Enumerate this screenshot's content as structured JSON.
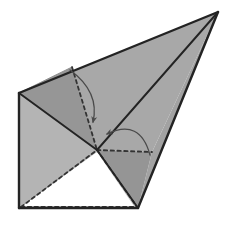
{
  "figure": {
    "type": "geometric-solid-diagram",
    "canvas": {
      "width": 235,
      "height": 235,
      "background": "#ffffff"
    },
    "colors": {
      "background": "#ffffff",
      "face_light": "#c9c9c9",
      "face_mid": "#b0b0b0",
      "face_medium": "#a8a8a8",
      "face_dark": "#999999",
      "face_darker": "#8f8f8f",
      "face_white": "#ffffff",
      "edge_solid": "#232323",
      "edge_thin": "#7a7a7a",
      "edge_hidden": "#3a3a3a",
      "arrow": "#4a4a4a"
    },
    "vertices": {
      "apex_top_right": [
        218,
        12
      ],
      "left": [
        19,
        93
      ],
      "bottom_left": [
        19,
        208
      ],
      "bottom_right": [
        138,
        208
      ],
      "hidden_center": [
        97,
        150
      ],
      "hidden_upper": [
        72,
        67
      ],
      "hidden_right": [
        152,
        152
      ]
    },
    "faces": [
      {
        "name": "upper-large-face",
        "shade": "#a8a8a8",
        "points": "19,93 218,12 152,152 97,150"
      },
      {
        "name": "upper-left-dark-face",
        "shade": "#969696",
        "points": "19,93 72,67 97,150"
      },
      {
        "name": "left-side-face",
        "shade": "#b4b4b4",
        "points": "19,93 97,150 19,208"
      },
      {
        "name": "lower-white-face",
        "shade": "#ffffff",
        "points": "19,208 97,150 138,208"
      },
      {
        "name": "lower-right-dark-face",
        "shade": "#959595",
        "points": "97,150 152,152 138,208"
      },
      {
        "name": "right-lower-face",
        "shade": "#a2a2a2",
        "points": "152,152 218,12 138,208"
      },
      {
        "name": "bottom-strip-face",
        "shade": "#b8b8b8",
        "points": "19,208 138,208 97,150"
      }
    ],
    "solid_edges": [
      {
        "name": "edge-left-to-apex",
        "from": [
          19,
          93
        ],
        "to": [
          218,
          12
        ]
      },
      {
        "name": "edge-apex-to-bottom-right",
        "from": [
          218,
          12
        ],
        "to": [
          138,
          208
        ]
      },
      {
        "name": "edge-bottom",
        "from": [
          19,
          208
        ],
        "to": [
          138,
          208
        ]
      },
      {
        "name": "edge-left-vertical",
        "from": [
          19,
          93
        ],
        "to": [
          19,
          208
        ]
      },
      {
        "name": "edge-apex-to-hidden-center",
        "from": [
          218,
          12
        ],
        "to": [
          97,
          150
        ]
      },
      {
        "name": "edge-left-to-hidden-center",
        "from": [
          19,
          93
        ],
        "to": [
          97,
          150
        ]
      },
      {
        "name": "edge-hidden-center-to-bottom-right",
        "from": [
          97,
          150
        ],
        "to": [
          138,
          208
        ]
      }
    ],
    "thin_edges": [
      {
        "name": "thin-edge-bottom-left-to-hidden-center",
        "from": [
          19,
          208
        ],
        "to": [
          97,
          150
        ]
      },
      {
        "name": "thin-edge-bottom-left-diagonal",
        "from": [
          19,
          208
        ],
        "to": [
          138,
          208
        ]
      },
      {
        "name": "thin-edge-left-to-upper-hidden",
        "from": [
          19,
          93
        ],
        "to": [
          72,
          67
        ]
      }
    ],
    "dashed_edges": [
      {
        "name": "dashed-upper-fold",
        "from": [
          72,
          67
        ],
        "to": [
          97,
          150
        ]
      },
      {
        "name": "dashed-left-fold",
        "from": [
          19,
          93
        ],
        "to": [
          19,
          208
        ]
      },
      {
        "name": "dashed-bottom-left-to-hidden-center",
        "from": [
          19,
          208
        ],
        "to": [
          97,
          150
        ]
      },
      {
        "name": "dashed-bottom-fold",
        "from": [
          19,
          208
        ],
        "to": [
          138,
          208
        ]
      },
      {
        "name": "dashed-right-fold",
        "from": [
          97,
          150
        ],
        "to": [
          152,
          152
        ]
      },
      {
        "name": "dashed-hidden-center-to-bottom-right",
        "from": [
          97,
          150
        ],
        "to": [
          138,
          208
        ]
      }
    ],
    "arrows": [
      {
        "name": "fold-arrow-upper",
        "start": [
          70,
          70
        ],
        "control": [
          100,
          92
        ],
        "end": [
          93,
          122
        ],
        "label": ""
      },
      {
        "name": "fold-arrow-lower",
        "start": [
          150,
          155
        ],
        "control": [
          140,
          118
        ],
        "end": [
          107,
          134
        ],
        "label": ""
      }
    ]
  }
}
